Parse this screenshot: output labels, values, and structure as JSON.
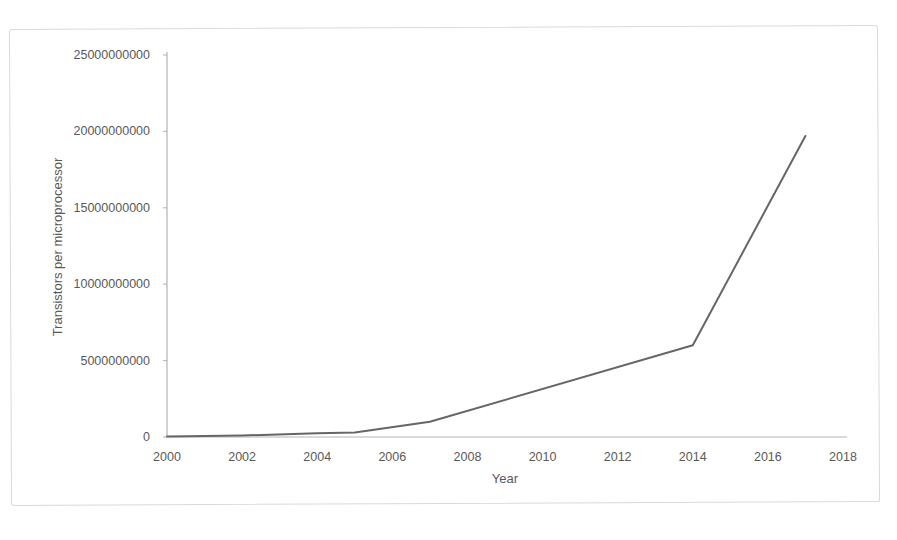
{
  "page": {
    "background_color": "#ffffff",
    "scan_border_color": "#dadada"
  },
  "chart_data": {
    "type": "line",
    "title": "",
    "xlabel": "Year",
    "ylabel": "Transistors per microprocessor",
    "points": [
      {
        "x": 2000,
        "y": 37500000
      },
      {
        "x": 2002,
        "y": 100000000
      },
      {
        "x": 2004,
        "y": 250000000
      },
      {
        "x": 2005,
        "y": 300000000
      },
      {
        "x": 2007,
        "y": 1000000000
      },
      {
        "x": 2014,
        "y": 6000000000
      },
      {
        "x": 2017,
        "y": 19700000000
      }
    ],
    "xlim": [
      2000,
      2018
    ],
    "ylim": [
      0,
      25000000000
    ],
    "x_ticks": [
      2000,
      2002,
      2004,
      2006,
      2008,
      2010,
      2012,
      2014,
      2016,
      2018
    ],
    "x_tick_labels": [
      "2000",
      "2002",
      "2004",
      "2006",
      "2008",
      "2010",
      "2012",
      "2014",
      "2016",
      "2018"
    ],
    "y_ticks": [
      0,
      5000000000,
      10000000000,
      15000000000,
      20000000000,
      25000000000
    ],
    "y_tick_labels": [
      "0",
      "5000000000",
      "10000000000",
      "15000000000",
      "20000000000",
      "25000000000"
    ],
    "grid": false,
    "legend": "none",
    "line_color": "#666666",
    "axis_color": "#b3b3b3",
    "text_color": "#595959"
  }
}
